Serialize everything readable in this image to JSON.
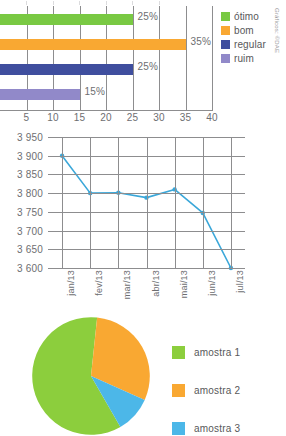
{
  "page": {
    "credit": "Gráficos: ©DAE"
  },
  "chart_data": [
    {
      "type": "bar",
      "orientation": "horizontal",
      "title": "",
      "xlabel": "",
      "ylabel": "",
      "categories": [
        "ótimo",
        "bom",
        "regular",
        "ruim"
      ],
      "values": [
        25,
        35,
        25,
        15
      ],
      "value_labels": [
        "25%",
        "35%",
        "25%",
        "15%"
      ],
      "colors": [
        "#79c943",
        "#f9a832",
        "#3f4e9e",
        "#9189c9"
      ],
      "xlim": [
        0,
        40
      ],
      "xticks": [
        5,
        10,
        15,
        20,
        25,
        30,
        35,
        40
      ],
      "xtick_labels": [
        "5",
        "10",
        "15",
        "20",
        "25",
        "30",
        "35",
        "40"
      ],
      "grid": true,
      "legend": {
        "position": "right",
        "entries": [
          {
            "label": "ótimo",
            "color": "#79c943"
          },
          {
            "label": "bom",
            "color": "#f9a832"
          },
          {
            "label": "regular",
            "color": "#3f4e9e"
          },
          {
            "label": "ruim",
            "color": "#9189c9"
          }
        ]
      }
    },
    {
      "type": "line",
      "title": "",
      "xlabel": "",
      "ylabel": "",
      "color": "#3aa7d9",
      "x": [
        "jan/13",
        "fev/13",
        "mar/13",
        "abr/13",
        "mai/13",
        "jun/13",
        "jul/13"
      ],
      "values": [
        3900,
        3800,
        3801,
        3788,
        3810,
        3747,
        3600
      ],
      "ylim": [
        3600,
        3950
      ],
      "yticks": [
        3600,
        3650,
        3700,
        3750,
        3800,
        3850,
        3900,
        3950
      ],
      "ytick_labels": [
        "3 600",
        "3 650",
        "3 700",
        "3 750",
        "3 800",
        "3 850",
        "3 900",
        "3 950"
      ],
      "grid": true,
      "markers": true,
      "legend": {
        "position": "none",
        "entries": []
      }
    },
    {
      "type": "pie",
      "title": "",
      "labels": [
        "amostra 1",
        "amostra 2",
        "amostra 3"
      ],
      "values": [
        60,
        30,
        10
      ],
      "colors": [
        "#8cce3d",
        "#f9a832",
        "#4cb7e8"
      ],
      "start_angle": 60,
      "legend": {
        "position": "right",
        "entries": [
          {
            "label": "amostra 1",
            "color": "#8cce3d"
          },
          {
            "label": "amostra 2",
            "color": "#f9a832"
          },
          {
            "label": "amostra 3",
            "color": "#4cb7e8"
          }
        ]
      }
    }
  ]
}
